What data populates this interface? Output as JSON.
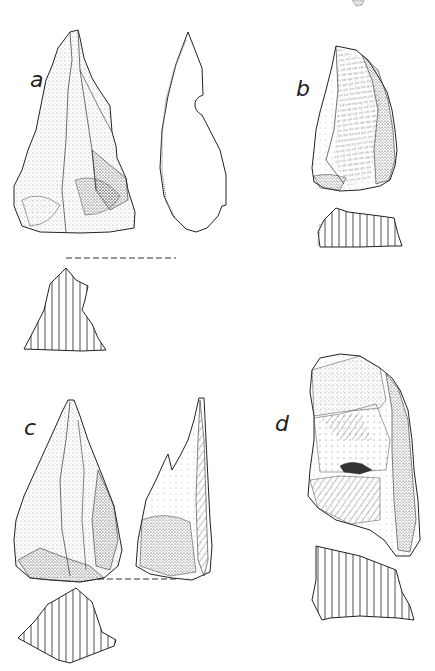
{
  "figure": {
    "specimens": [
      {
        "id": "a",
        "label": "a",
        "views": [
          "dorsal face",
          "profile outline",
          "cross-section"
        ]
      },
      {
        "id": "b",
        "label": "b",
        "views": [
          "dorsal face",
          "cross-section"
        ]
      },
      {
        "id": "c",
        "label": "c",
        "views": [
          "dorsal face",
          "profile",
          "cross-section"
        ]
      },
      {
        "id": "d",
        "label": "d",
        "views": [
          "dorsal face",
          "cross-section"
        ]
      }
    ],
    "colors": {
      "ink": "#222222",
      "background": "#ffffff"
    }
  }
}
